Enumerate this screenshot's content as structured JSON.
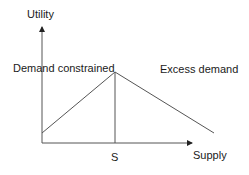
{
  "diagram": {
    "axes": {
      "y_label": "Utility",
      "x_label": "Supply"
    },
    "annotations": {
      "left_region": "Demand constrained",
      "right_region": "Excess demand",
      "peak_marker": "S"
    },
    "colors": {
      "line": "#555555",
      "text": "#1a1a1a",
      "background": "#ffffff"
    },
    "geometry": {
      "origin": [
        42,
        143
      ],
      "y_axis_top": [
        42,
        25
      ],
      "x_axis_end": [
        194,
        143
      ],
      "left_line": [
        [
          42,
          133
        ],
        [
          115,
          72
        ]
      ],
      "right_line": [
        [
          115,
          72
        ],
        [
          214,
          133
        ]
      ],
      "vertical_line": [
        [
          115,
          72
        ],
        [
          115,
          143
        ]
      ]
    }
  }
}
